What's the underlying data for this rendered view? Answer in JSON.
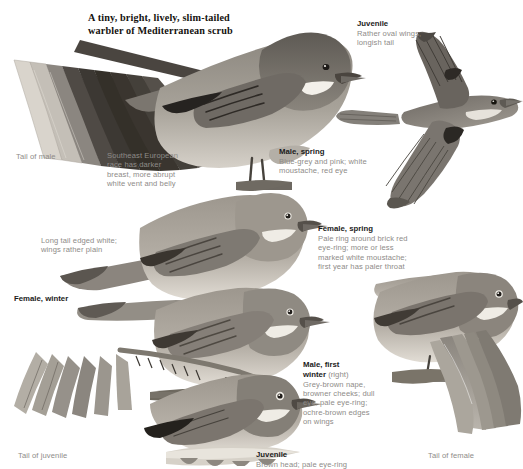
{
  "plate": {
    "title": "A tiny, bright, lively, slim-tailed\nwarbler of Mediterranean scrub",
    "palette": {
      "ink": "#1b1b1b",
      "caption_gray": "#8e8b88",
      "plumage_dark": "#6a6660",
      "plumage_mid": "#9b968e",
      "plumage_light": "#cfcac2",
      "background": "#ffffff"
    }
  },
  "labels": {
    "juvenile_flight": {
      "heading": "Juvenile",
      "caption": "Rather oval wings,\nlongish tail"
    },
    "tail_of_male": {
      "text": "Tail of male"
    },
    "race_note": {
      "text": "Southeast European\nrace has darker\nbreast, more abrupt\nwhite vent and belly"
    },
    "male_spring": {
      "heading": "Male, spring",
      "caption": "Blue-grey and pink; white\nmoustache, red eye"
    },
    "long_tail_note": {
      "text": "Long tail edged white;\nwings rather plain"
    },
    "female_spring": {
      "heading": "Female, spring",
      "caption": "Pale ring around brick red\neye-ring; more or less\nmarked white moustache;\nfirst year has paler throat"
    },
    "female_winter": {
      "text": "Female, winter"
    },
    "male_first_winter": {
      "heading": "Male, first",
      "heading2": "winter",
      "side": " (right)",
      "caption": "Grey-brown nape,\nbrowner cheeks; dull\neye, pale eye-ring;\nochre-brown edges\non wings"
    },
    "juvenile_perched": {
      "heading": "Juvenile",
      "caption": "Brown head; pale eye-ring"
    },
    "tail_of_juvenile": {
      "text": "Tail of juvenile"
    },
    "tail_of_female": {
      "text": "Tail of female"
    }
  }
}
